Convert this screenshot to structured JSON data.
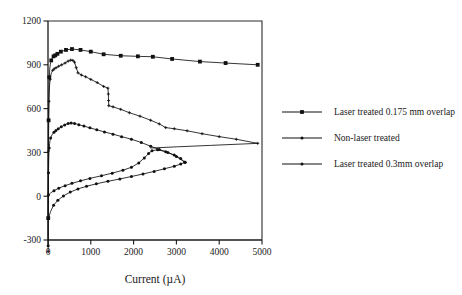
{
  "chart_data": {
    "type": "line",
    "title": "",
    "xlabel": "Current (µA)",
    "ylabel": "",
    "xlim": [
      0,
      5000
    ],
    "ylim": [
      -300,
      1200
    ],
    "xticks": [
      0,
      1000,
      2000,
      3000,
      4000,
      5000
    ],
    "yticks": [
      -300,
      0,
      300,
      600,
      900,
      1200
    ],
    "xtick_labels": [
      "0",
      "1000",
      "2000",
      "3000",
      "4000",
      "5000"
    ],
    "ytick_labels": [
      "-300",
      "0",
      "300",
      "600",
      "900",
      "1200"
    ],
    "grid": false,
    "legend_position": "right",
    "series": [
      {
        "name": "Laser treated 0.175 mm overlap",
        "marker": "square",
        "points": [
          [
            5,
            -150
          ],
          [
            8,
            120
          ],
          [
            10,
            330
          ],
          [
            14,
            520
          ],
          [
            18,
            650
          ],
          [
            24,
            745
          ],
          [
            30,
            815
          ],
          [
            40,
            870
          ],
          [
            55,
            905
          ],
          [
            75,
            930
          ],
          [
            100,
            948
          ],
          [
            130,
            958
          ],
          [
            170,
            965
          ],
          [
            220,
            975
          ],
          [
            300,
            990
          ],
          [
            420,
            1002
          ],
          [
            560,
            1008
          ],
          [
            760,
            1002
          ],
          [
            1000,
            990
          ],
          [
            1300,
            972
          ],
          [
            1700,
            962
          ],
          [
            2100,
            958
          ],
          [
            2450,
            955
          ],
          [
            2900,
            940
          ],
          [
            3550,
            922
          ],
          [
            4150,
            912
          ],
          [
            4900,
            900
          ]
        ]
      },
      {
        "name": "Non-laser treated",
        "marker": "plus",
        "points": [
          [
            4,
            -380
          ],
          [
            6,
            -120
          ],
          [
            8,
            110
          ],
          [
            11,
            310
          ],
          [
            14,
            450
          ],
          [
            18,
            560
          ],
          [
            23,
            650
          ],
          [
            30,
            715
          ],
          [
            38,
            765
          ],
          [
            50,
            800
          ],
          [
            65,
            828
          ],
          [
            85,
            848
          ],
          [
            110,
            862
          ],
          [
            145,
            872
          ],
          [
            190,
            880
          ],
          [
            250,
            890
          ],
          [
            320,
            900
          ],
          [
            400,
            912
          ],
          [
            470,
            925
          ],
          [
            530,
            932
          ],
          [
            580,
            930
          ],
          [
            620,
            918
          ],
          [
            660,
            880
          ],
          [
            700,
            845
          ],
          [
            780,
            830
          ],
          [
            880,
            818
          ],
          [
            1000,
            800
          ],
          [
            1150,
            778
          ],
          [
            1300,
            752
          ],
          [
            1400,
            740
          ],
          [
            1410,
            700
          ],
          [
            1415,
            655
          ],
          [
            1420,
            620
          ],
          [
            1520,
            612
          ],
          [
            1700,
            595
          ],
          [
            1900,
            572
          ],
          [
            2150,
            548
          ],
          [
            2400,
            520
          ],
          [
            2600,
            495
          ],
          [
            2750,
            470
          ],
          [
            2950,
            462
          ],
          [
            3250,
            448
          ],
          [
            3600,
            428
          ],
          [
            4000,
            408
          ],
          [
            4400,
            390
          ],
          [
            4900,
            362
          ]
        ]
      },
      {
        "name": "Laser treated 0.3mm overlap",
        "marker": "circle",
        "points": [
          [
            4,
            -340
          ],
          [
            6,
            -110
          ],
          [
            9,
            60
          ],
          [
            12,
            160
          ],
          [
            16,
            235
          ],
          [
            21,
            290
          ],
          [
            28,
            330
          ],
          [
            37,
            360
          ],
          [
            48,
            382
          ],
          [
            62,
            398
          ],
          [
            80,
            412
          ],
          [
            105,
            425
          ],
          [
            140,
            438
          ],
          [
            185,
            450
          ],
          [
            240,
            462
          ],
          [
            310,
            475
          ],
          [
            390,
            488
          ],
          [
            470,
            498
          ],
          [
            540,
            502
          ],
          [
            620,
            498
          ],
          [
            720,
            490
          ],
          [
            840,
            480
          ],
          [
            980,
            468
          ],
          [
            1140,
            455
          ],
          [
            1320,
            440
          ],
          [
            1520,
            425
          ],
          [
            1720,
            408
          ],
          [
            1950,
            390
          ],
          [
            2180,
            368
          ],
          [
            2400,
            342
          ],
          [
            2600,
            320
          ],
          [
            2800,
            300
          ],
          [
            3000,
            272
          ],
          [
            3200,
            232
          ]
        ]
      },
      {
        "name": "rising-branch-upper",
        "marker": "circle",
        "linked_to": "Laser treated 0.3mm overlap",
        "points": [
          [
            10,
            8
          ],
          [
            60,
            22
          ],
          [
            140,
            38
          ],
          [
            250,
            55
          ],
          [
            400,
            72
          ],
          [
            560,
            88
          ],
          [
            760,
            105
          ],
          [
            980,
            122
          ],
          [
            1250,
            140
          ],
          [
            1500,
            158
          ],
          [
            1750,
            178
          ],
          [
            1950,
            198
          ],
          [
            2120,
            228
          ],
          [
            2250,
            262
          ],
          [
            2350,
            292
          ],
          [
            2430,
            312
          ],
          [
            2560,
            318
          ],
          [
            2750,
            305
          ],
          [
            2950,
            282
          ],
          [
            3100,
            258
          ],
          [
            3200,
            232
          ]
        ]
      },
      {
        "name": "rising-branch-lower",
        "marker": "circle",
        "linked_to": "Laser treated 0.3mm overlap",
        "points": [
          [
            12,
            -152
          ],
          [
            60,
            -105
          ],
          [
            130,
            -62
          ],
          [
            230,
            -28
          ],
          [
            360,
            2
          ],
          [
            520,
            28
          ],
          [
            700,
            50
          ],
          [
            900,
            68
          ],
          [
            1130,
            85
          ],
          [
            1400,
            102
          ],
          [
            1680,
            118
          ],
          [
            1950,
            135
          ],
          [
            2220,
            152
          ],
          [
            2480,
            170
          ],
          [
            2720,
            188
          ],
          [
            2950,
            205
          ],
          [
            3100,
            220
          ],
          [
            3200,
            232
          ]
        ]
      },
      {
        "name": "convergence-segment",
        "marker": "none",
        "points": [
          [
            2400,
            330
          ],
          [
            3000,
            338
          ],
          [
            3800,
            348
          ],
          [
            4900,
            362
          ]
        ]
      }
    ],
    "legend_entries": [
      {
        "label": "Laser treated 0.175 mm overlap",
        "marker": "square"
      },
      {
        "label": "Non-laser treated",
        "marker": "plus"
      },
      {
        "label": "Laser treated 0.3mm overlap",
        "marker": "circle"
      }
    ],
    "colors": {
      "line": "#111111",
      "axis": "#1a1a1a",
      "frame": "#2b2b2b",
      "background": "#ffffff"
    }
  }
}
